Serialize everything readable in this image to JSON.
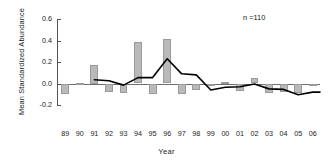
{
  "chart_data": {
    "type": "bar",
    "title": "",
    "xlabel": "Year",
    "ylabel": "Mean Standardized Abundance",
    "ylim": [
      -0.2,
      0.6
    ],
    "yticks": [
      0.6,
      0.4,
      0.2,
      0.0,
      -0.2
    ],
    "ytick_labels": [
      "0.6",
      "0.4",
      "0.2",
      "0.0",
      "-0.2"
    ],
    "grid": false,
    "legend": null,
    "annotation": "n =110",
    "categories": [
      "89",
      "90",
      "91",
      "92",
      "93",
      "94",
      "95",
      "96",
      "97",
      "98",
      "99",
      "00",
      "01",
      "02",
      "03",
      "04",
      "05",
      "06"
    ],
    "series": [
      {
        "name": "Mean Standardized Abundance",
        "type": "bar",
        "color": "#b9b9b9",
        "values": [
          -0.1,
          0.005,
          0.175,
          -0.075,
          -0.085,
          0.39,
          -0.095,
          0.41,
          -0.095,
          -0.065,
          0.0,
          0.015,
          -0.07,
          0.055,
          -0.085,
          -0.075,
          -0.085,
          -0.01
        ]
      },
      {
        "name": "Smoothed trend",
        "type": "line",
        "color": "#000000",
        "values": [
          null,
          null,
          0.035,
          0.025,
          -0.015,
          0.055,
          0.055,
          0.23,
          0.09,
          0.08,
          -0.06,
          -0.035,
          -0.03,
          -0.005,
          -0.05,
          -0.055,
          -0.105,
          -0.08
        ]
      }
    ]
  }
}
